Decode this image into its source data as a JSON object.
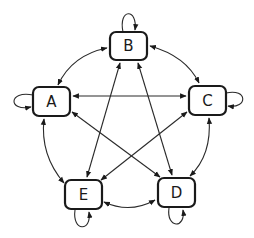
{
  "diagram": {
    "type": "state-transition-graph",
    "stroke_color": "#1a1a1a",
    "background": "#ffffff",
    "nodes": [
      {
        "id": "A",
        "label": "A",
        "x": 33,
        "y": 87,
        "w": 37,
        "h": 29
      },
      {
        "id": "B",
        "label": "B",
        "x": 110,
        "y": 32,
        "w": 37,
        "h": 28
      },
      {
        "id": "C",
        "label": "C",
        "x": 189,
        "y": 86,
        "w": 37,
        "h": 29
      },
      {
        "id": "D",
        "label": "D",
        "x": 158,
        "y": 178,
        "w": 37,
        "h": 29
      },
      {
        "id": "E",
        "label": "E",
        "x": 65,
        "y": 180,
        "w": 37,
        "h": 29
      }
    ],
    "edges": [
      {
        "from": "A",
        "to": "A",
        "kind": "self-loop"
      },
      {
        "from": "B",
        "to": "B",
        "kind": "self-loop"
      },
      {
        "from": "C",
        "to": "C",
        "kind": "self-loop"
      },
      {
        "from": "D",
        "to": "D",
        "kind": "self-loop"
      },
      {
        "from": "E",
        "to": "E",
        "kind": "self-loop"
      },
      {
        "from": "A",
        "to": "B",
        "kind": "bidirectional-arc"
      },
      {
        "from": "B",
        "to": "C",
        "kind": "bidirectional-arc"
      },
      {
        "from": "C",
        "to": "D",
        "kind": "bidirectional-arc"
      },
      {
        "from": "D",
        "to": "E",
        "kind": "bidirectional-arc"
      },
      {
        "from": "E",
        "to": "A",
        "kind": "bidirectional-arc"
      },
      {
        "from": "A",
        "to": "C",
        "kind": "bidirectional-straight"
      },
      {
        "from": "A",
        "to": "D",
        "kind": "bidirectional-straight"
      },
      {
        "from": "B",
        "to": "D",
        "kind": "bidirectional-straight"
      },
      {
        "from": "B",
        "to": "E",
        "kind": "bidirectional-straight"
      },
      {
        "from": "C",
        "to": "E",
        "kind": "bidirectional-straight"
      }
    ]
  }
}
